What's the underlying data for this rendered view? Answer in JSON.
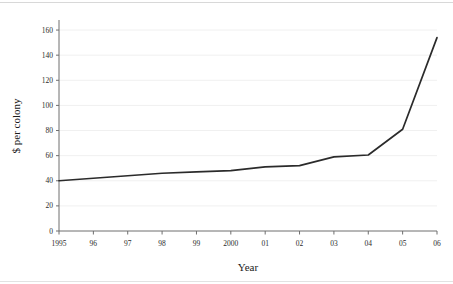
{
  "chart_data": {
    "type": "line",
    "title": "",
    "xlabel": "Year",
    "ylabel": "$ per colony",
    "x": [
      1995,
      1996,
      1997,
      1998,
      1999,
      2000,
      2001,
      2002,
      2003,
      2004,
      2005,
      2006
    ],
    "xtick_labels": [
      "1995",
      "96",
      "97",
      "98",
      "99",
      "2000",
      "01",
      "02",
      "03",
      "04",
      "05",
      "06"
    ],
    "values": [
      40,
      42,
      44,
      46,
      47,
      48,
      51,
      52,
      59,
      60.5,
      81,
      154
    ],
    "ytick_labels": [
      "0",
      "20",
      "40",
      "60",
      "80",
      "100",
      "120",
      "140",
      "160"
    ],
    "yticks": [
      0,
      20,
      40,
      60,
      80,
      100,
      120,
      140,
      160
    ],
    "ylim": [
      0,
      168
    ],
    "xlim": [
      1995,
      2006
    ],
    "grid": true,
    "legend": false,
    "series_name": "$ per colony",
    "line_color": "#2b2b2b",
    "grid_color": "#f0f0f0",
    "axis_color": "#6e6e6e",
    "background": "#ffffff"
  }
}
